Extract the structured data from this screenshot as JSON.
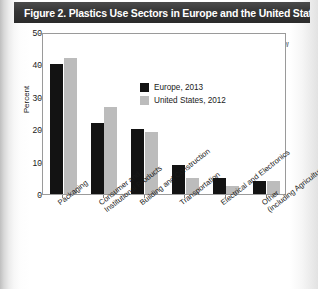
{
  "figure": {
    "title": "Figure 2. Plastics Use Sectors in Europe and the United States",
    "sources_note": "Sources: PlasticsEurope, American Chemistry Council"
  },
  "legend": {
    "items": [
      {
        "label": "Europe, 2013",
        "color": "#131313",
        "swatch_name": "legend-swatch-europe"
      },
      {
        "label": "United States, 2012",
        "color": "#bcbcbc",
        "swatch_name": "legend-swatch-united-states"
      }
    ]
  },
  "axes": {
    "y_title": "Percent",
    "y_ticks": [
      "0",
      "10",
      "20",
      "30",
      "40",
      "50"
    ]
  },
  "chart_data": {
    "type": "bar",
    "title": "Figure 2. Plastics Use Sectors in Europe and the United States",
    "xlabel": "",
    "ylabel": "Percent",
    "ylim": [
      0,
      50
    ],
    "ytick_step": 10,
    "grid": false,
    "legend_position": "upper-center-inside",
    "annotations": [
      "Sources: PlasticsEurope, American Chemistry Council"
    ],
    "categories": [
      "Packaging",
      "Consumer and Institutional Products",
      "Building and Construction",
      "Transportation",
      "Electrical and Electronics",
      "Other (including Agriculture)"
    ],
    "category_lines": [
      [
        "Packaging"
      ],
      [
        "Consumer and",
        "Institutional Products"
      ],
      [
        "Building and Construction"
      ],
      [
        "Transportation"
      ],
      [
        "Electrical and Electronics"
      ],
      [
        "Other",
        "(including Agriculture)"
      ]
    ],
    "series": [
      {
        "name": "Europe, 2013",
        "color": "#131313",
        "values": [
          40,
          22,
          20,
          9,
          5,
          4
        ]
      },
      {
        "name": "United States, 2012",
        "color": "#bcbcbc",
        "values": [
          42,
          27,
          19,
          5,
          2.5,
          4
        ]
      }
    ]
  }
}
